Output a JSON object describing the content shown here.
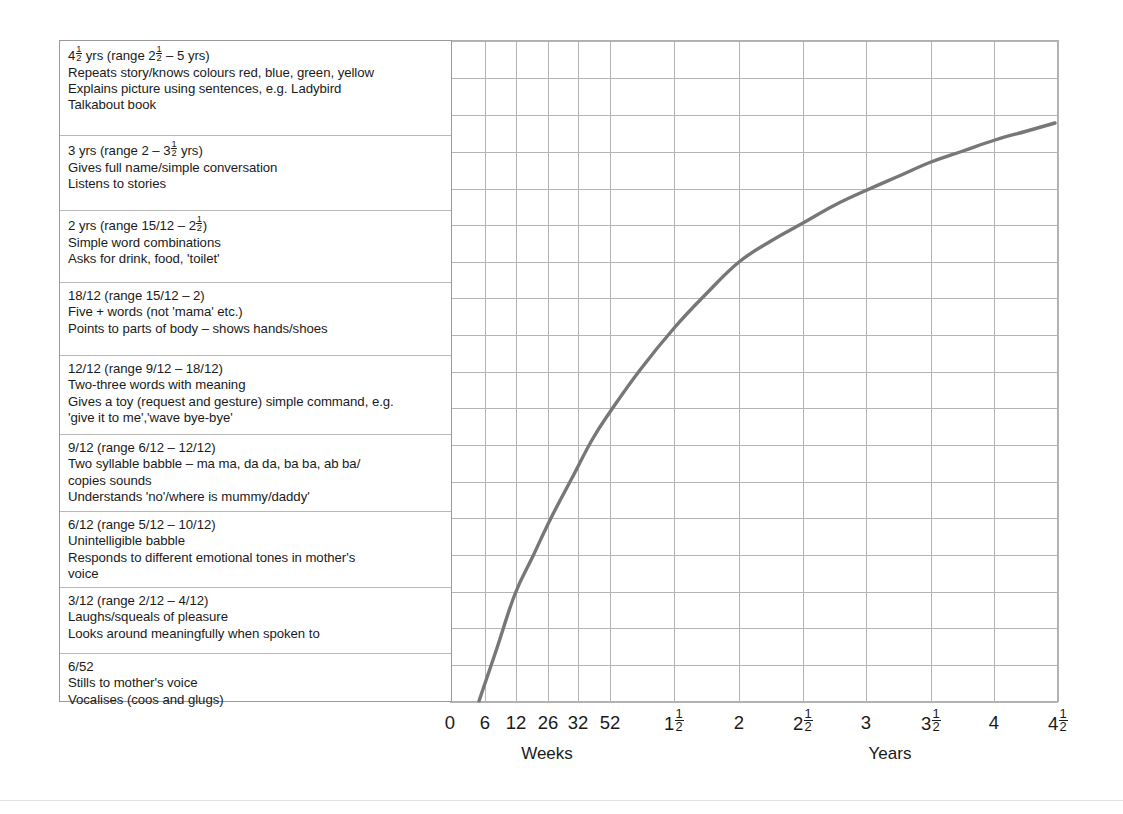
{
  "colors": {
    "curve": "#777777",
    "grid": "#b4b4b4",
    "panel_border": "#9a9a9a",
    "row_divider": "#b9b9b9",
    "text": "#1a1a1a",
    "background": "#ffffff"
  },
  "milestones": [
    {
      "id": "4-and-half-years",
      "lines": [
        "4½ yrs (range 2½ – 5 yrs)",
        "Repeats story/knows colours red, blue, green, yellow",
        "Explains picture using sentences, e.g. Ladybird",
        "Talkabout book"
      ]
    },
    {
      "id": "3-years",
      "lines": [
        "3 yrs (range 2 – 3½ yrs)",
        "Gives full name/simple conversation",
        "Listens to stories"
      ]
    },
    {
      "id": "2-years",
      "lines": [
        "2 yrs (range 15/12 – 2½)",
        "Simple word combinations",
        "Asks for drink, food, 'toilet'"
      ]
    },
    {
      "id": "18-months",
      "lines": [
        "18/12 (range 15/12 – 2)",
        "Five + words (not 'mama' etc.)",
        "Points to parts of body – shows hands/shoes"
      ]
    },
    {
      "id": "12-months",
      "lines": [
        "12/12 (range 9/12 – 18/12)",
        "Two-three words with meaning",
        "Gives a toy (request and gesture) simple command, e.g.",
        "'give it to me','wave bye-bye'"
      ]
    },
    {
      "id": "9-months",
      "lines": [
        "9/12 (range 6/12 – 12/12)",
        "Two syllable babble – ma ma, da da, ba ba, ab ba/",
        "copies sounds",
        "Understands 'no'/where is mummy/daddy'"
      ]
    },
    {
      "id": "6-months",
      "lines": [
        "6/12 (range 5/12 – 10/12)",
        "Unintelligible babble",
        "Responds to different emotional tones in mother's",
        "voice"
      ]
    },
    {
      "id": "3-months",
      "lines": [
        "3/12 (range 2/12 – 4/12)",
        "Laughs/squeals of pleasure",
        "Looks around meaningfully when spoken to"
      ]
    },
    {
      "id": "6-weeks",
      "lines": [
        "6/52",
        "Stills to mother's voice",
        "Vocalises (coos and glugs)"
      ]
    }
  ],
  "chart_data": {
    "type": "line",
    "title": "",
    "xlabel": "",
    "ylabel": "",
    "grid": true,
    "legend": "none",
    "annotations": [
      "Weeks",
      "Years"
    ],
    "axis_groups": [
      {
        "label": "Weeks",
        "center_px": 547,
        "ticks": [
          "0",
          "6",
          "12",
          "26",
          "32",
          "52"
        ]
      },
      {
        "label": "Years",
        "center_px": 890,
        "ticks": [
          "1½",
          "2",
          "2½",
          "3",
          "3½",
          "4",
          "4½"
        ]
      }
    ],
    "x_ticks": [
      {
        "label": "0",
        "whole": "0",
        "frac_num": "",
        "frac_den": "",
        "px": 450
      },
      {
        "label": "6",
        "whole": "6",
        "frac_num": "",
        "frac_den": "",
        "px": 485
      },
      {
        "label": "12",
        "whole": "12",
        "frac_num": "",
        "frac_den": "",
        "px": 516
      },
      {
        "label": "26",
        "whole": "26",
        "frac_num": "",
        "frac_den": "",
        "px": 548
      },
      {
        "label": "32",
        "whole": "32",
        "frac_num": "",
        "frac_den": "",
        "px": 578
      },
      {
        "label": "52",
        "whole": "52",
        "frac_num": "",
        "frac_den": "",
        "px": 610
      },
      {
        "label": "1½",
        "whole": "1",
        "frac_num": "1",
        "frac_den": "2",
        "px": 674
      },
      {
        "label": "2",
        "whole": "2",
        "frac_num": "",
        "frac_den": "",
        "px": 739
      },
      {
        "label": "2½",
        "whole": "2",
        "frac_num": "1",
        "frac_den": "2",
        "px": 803
      },
      {
        "label": "3",
        "whole": "3",
        "frac_num": "",
        "frac_den": "",
        "px": 866
      },
      {
        "label": "3½",
        "whole": "3",
        "frac_num": "1",
        "frac_den": "2",
        "px": 931
      },
      {
        "label": "4",
        "whole": "4",
        "frac_num": "",
        "frac_den": "",
        "px": 994
      },
      {
        "label": "4½",
        "whole": "4",
        "frac_num": "1",
        "frac_den": "2",
        "px": 1058
      }
    ],
    "vertical_gridlines_px": [
      450,
      485,
      516,
      548,
      578,
      610,
      674,
      739,
      803,
      866,
      931,
      994,
      1058
    ],
    "horizontal_gridlines_px": [
      41,
      78,
      115,
      152,
      189,
      225,
      262,
      298,
      335,
      372,
      408,
      445,
      482,
      518,
      555,
      592,
      628,
      665,
      702
    ],
    "curve_points_px": [
      [
        479,
        701
      ],
      [
        497,
        648
      ],
      [
        515,
        594
      ],
      [
        533,
        556
      ],
      [
        551,
        518
      ],
      [
        572,
        478
      ],
      [
        592,
        440
      ],
      [
        610,
        412
      ],
      [
        640,
        370
      ],
      [
        675,
        327
      ],
      [
        707,
        293
      ],
      [
        739,
        262
      ],
      [
        771,
        241
      ],
      [
        803,
        223
      ],
      [
        835,
        205
      ],
      [
        867,
        190
      ],
      [
        899,
        176
      ],
      [
        931,
        162
      ],
      [
        963,
        151
      ],
      [
        995,
        140
      ],
      [
        1027,
        131
      ],
      [
        1055,
        123
      ]
    ],
    "curve_description": "Cumulative language-development progress rising steeply from 6 weeks through 52 weeks then flattening through 4½ years"
  }
}
